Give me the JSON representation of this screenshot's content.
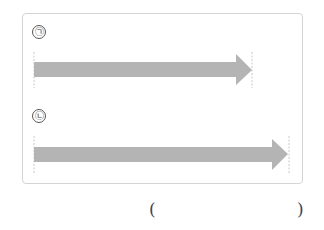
{
  "figure": {
    "items": [
      {
        "label": "㉠",
        "start_x": 34,
        "end_x": 252,
        "shaft_top": 62,
        "shaft_bottom": 77,
        "head_top": 54,
        "head_bottom": 85,
        "head_start_x": 236
      },
      {
        "label": "㉡",
        "start_x": 34,
        "end_x": 288,
        "shaft_top": 147,
        "shaft_bottom": 162,
        "head_top": 139,
        "head_bottom": 170,
        "head_start_x": 272
      }
    ],
    "arrow_color": "#b4b4b4",
    "guide_color": "#bbbbbb"
  },
  "answer": {
    "open_paren": "(",
    "close_paren": ")",
    "value": ""
  }
}
